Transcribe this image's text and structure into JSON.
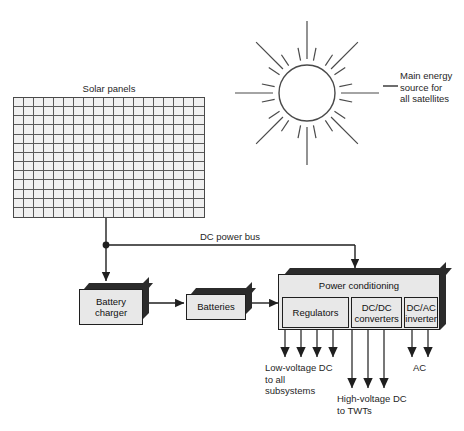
{
  "diagram": {
    "title_solar": "Solar panels",
    "sun_note": "Main energy\nsource for\nall satellites",
    "bus_label": "DC power bus",
    "boxes": {
      "battery_charger": "Battery\ncharger",
      "batteries": "Batteries",
      "power_conditioning": "Power conditioning",
      "regulators": "Regulators",
      "dcdc": "DC/DC\nconverters",
      "dcac": "DC/AC\ninverter"
    },
    "outputs": {
      "low_voltage": "Low-voltage DC\nto all\nsubsystems",
      "high_voltage": "High-voltage DC\nto TWTs",
      "ac": "AC"
    },
    "grid": {
      "cols": 19,
      "rows": 13
    },
    "sun": {
      "center_x": 307,
      "center_y": 93,
      "radius": 28,
      "long_rays": 8,
      "short_rays": 16,
      "long_ray_outer": 72,
      "short_ray_inner": 33,
      "short_ray_outer": 46
    },
    "colors": {
      "line": "#1f1f1f",
      "sun_stroke": "#4a4a4a",
      "cell_fill": "#f0f0f0",
      "box_face": "#e8e8e8",
      "box_shadow": "#2b2b2b",
      "background": "#ffffff"
    },
    "arrow_counts": {
      "low_voltage": 4,
      "high_voltage": 3,
      "ac": 2
    }
  }
}
